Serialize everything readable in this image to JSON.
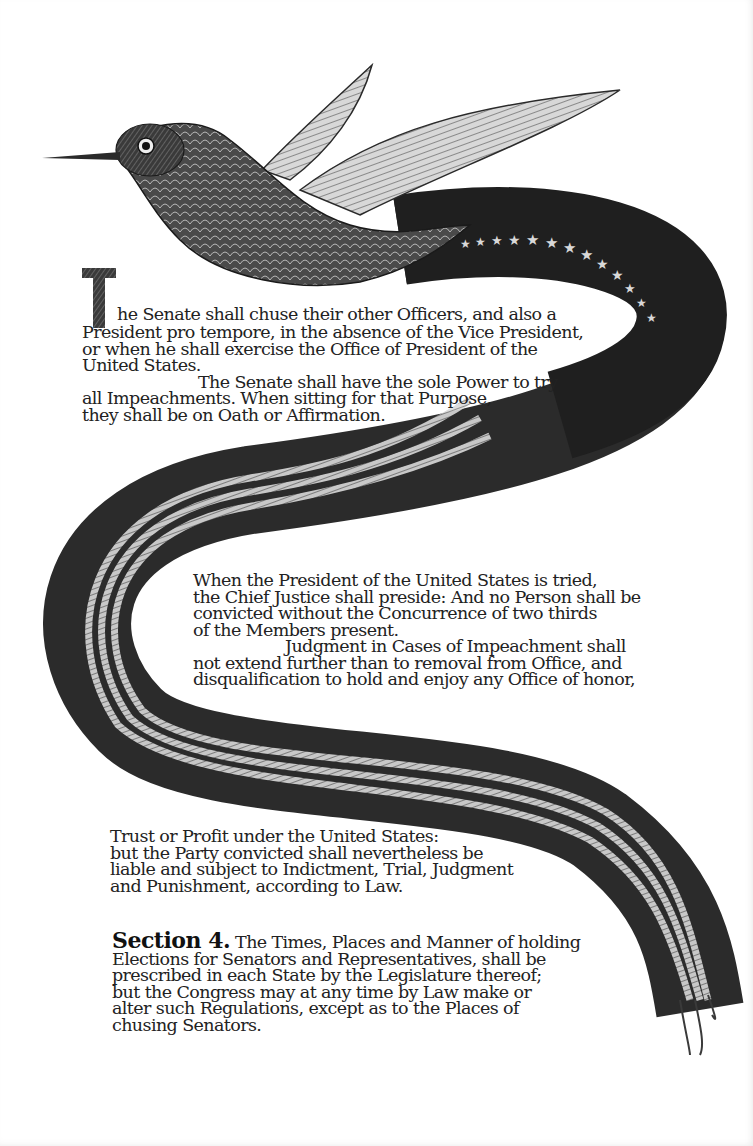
{
  "document": {
    "type": "illustrated-constitution-page",
    "illustration": {
      "subject": "hummingbird with flag-striped ribbon tail",
      "stars_count": 13,
      "colors": {
        "ink": "#1e1e1e",
        "ribbon_dark": "#2a2a2a",
        "paper": "#ffffff"
      }
    },
    "passage1": {
      "drop_cap": "T",
      "lines": [
        "he Senate shall chuse their other Officers, and also a",
        "President pro tempore, in the absence of the Vice President,",
        "or when he shall exercise the Office of President of the",
        "United States.",
        "The Senate shall have the sole Power to try",
        "all Impeachments. When sitting for that Purpose,",
        "they shall be on Oath or Affirmation."
      ]
    },
    "passage2": {
      "lines": [
        "When the President of the United States is tried,",
        "the Chief Justice shall preside: And no Person shall be",
        "convicted without the Concurrence of two thirds",
        "of the Members present.",
        "Judgment in Cases of Impeachment shall",
        "not extend further than to removal from Office, and",
        "disqualification to hold and enjoy any Office of honor,"
      ]
    },
    "passage3": {
      "lines": [
        "Trust or Profit under the United States:",
        "but the Party convicted shall nevertheless be",
        "liable and subject to Indictment, Trial, Judgment",
        "and Punishment, according to Law."
      ]
    },
    "section4": {
      "label": "Section 4.",
      "first_line": "The Times, Places and Manner of holding",
      "lines": [
        "Elections for Senators and Representatives, shall be",
        "prescribed in each State by the Legislature thereof;",
        "but the Congress may at any time by Law make or",
        "alter such Regulations, except as to the Places of",
        "chusing Senators."
      ]
    }
  }
}
